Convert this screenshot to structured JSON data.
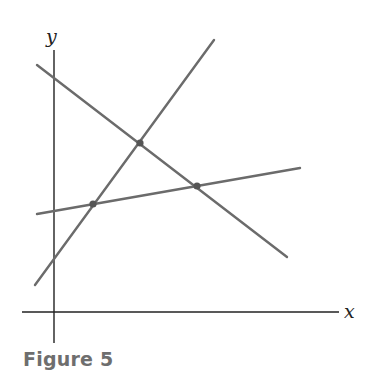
{
  "figure": {
    "caption": "Figure 5",
    "axes": {
      "x_label": "x",
      "y_label": "y",
      "x_axis": {
        "x1": 22,
        "y1": 312,
        "x2": 339,
        "y2": 312
      },
      "y_axis": {
        "x1": 54,
        "y1": 50,
        "x2": 54,
        "y2": 343
      },
      "x_label_pos": {
        "x": 344,
        "y": 318
      },
      "y_label_pos": {
        "x": 46,
        "y": 43
      },
      "color": "#222222"
    },
    "lines": [
      {
        "name": "steep-ascending-line",
        "x1": 35,
        "y1": 285,
        "x2": 214,
        "y2": 40
      },
      {
        "name": "descending-line",
        "x1": 37,
        "y1": 65,
        "x2": 287,
        "y2": 257
      },
      {
        "name": "shallow-ascending-line",
        "x1": 37,
        "y1": 214,
        "x2": 300,
        "y2": 168
      }
    ],
    "line_color": "#6b6b6b",
    "intersection_points": [
      {
        "name": "intersection-top",
        "x": 140,
        "y": 143
      },
      {
        "name": "intersection-left",
        "x": 93,
        "y": 204
      },
      {
        "name": "intersection-right",
        "x": 197,
        "y": 186
      }
    ],
    "point_color": "#555555"
  }
}
